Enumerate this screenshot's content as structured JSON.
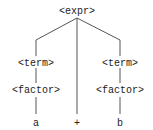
{
  "diagram": {
    "type": "parse-tree",
    "colors": {
      "edge": "#555555",
      "text": "#222222",
      "background": "#ffffff"
    },
    "nodes": {
      "root": {
        "label": "<expr>"
      },
      "term_left": {
        "label": "<term>"
      },
      "factor_left": {
        "label": "<factor>"
      },
      "leaf_a": {
        "label": "a"
      },
      "leaf_plus": {
        "label": "+"
      },
      "term_right": {
        "label": "<term>"
      },
      "factor_right": {
        "label": "<factor>"
      },
      "leaf_b": {
        "label": "b"
      }
    },
    "edges": [
      {
        "from": "root",
        "to": "term_left"
      },
      {
        "from": "root",
        "to": "leaf_plus"
      },
      {
        "from": "root",
        "to": "term_right"
      },
      {
        "from": "term_left",
        "to": "factor_left"
      },
      {
        "from": "factor_left",
        "to": "leaf_a"
      },
      {
        "from": "term_right",
        "to": "factor_right"
      },
      {
        "from": "factor_right",
        "to": "leaf_b"
      }
    ]
  }
}
